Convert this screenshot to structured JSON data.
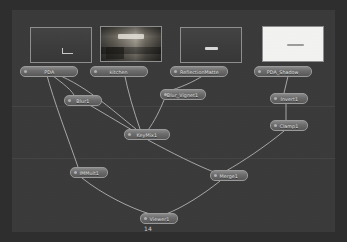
{
  "app": {
    "title": "Node Graph",
    "canvas_background": "#3a3a3a",
    "node_fill": "#6e6e6e",
    "node_border": "#9b9b9b",
    "link_color": "#c9c9c9"
  },
  "frame_counter": "14",
  "read_nodes": [
    {
      "id": "pda",
      "label": "PDA",
      "thumb_kind": "dark",
      "x": 18,
      "y": 17,
      "label_x": 8,
      "label_y": 56
    },
    {
      "id": "kitchen",
      "label": "kitchen",
      "thumb_kind": "photo",
      "x": 88,
      "y": 16,
      "label_x": 78,
      "label_y": 56
    },
    {
      "id": "reflectionmatte",
      "label": "ReflectionMatte",
      "thumb_kind": "dark",
      "x": 168,
      "y": 17,
      "label_x": 158,
      "label_y": 56
    },
    {
      "id": "pda_shadow",
      "label": "PDA_Shadow",
      "thumb_kind": "white",
      "x": 250,
      "y": 16,
      "label_x": 242,
      "label_y": 56
    }
  ],
  "op_nodes": [
    {
      "id": "blur1",
      "label": "Blur1",
      "size": "small",
      "x": 52,
      "y": 85
    },
    {
      "id": "blur_vignet1",
      "label": "Blur_Vignet1",
      "size": "med",
      "x": 148,
      "y": 79
    },
    {
      "id": "keymix1",
      "label": "KeyMix1",
      "size": "med",
      "x": 112,
      "y": 119
    },
    {
      "id": "invert1",
      "label": "Invert1",
      "size": "small",
      "x": 258,
      "y": 83
    },
    {
      "id": "clamp1",
      "label": "Clamp1",
      "size": "small",
      "x": 258,
      "y": 110
    },
    {
      "id": "immult1",
      "label": "IMMult1",
      "size": "small",
      "x": 58,
      "y": 157
    },
    {
      "id": "merge1",
      "label": "Merge1",
      "size": "small",
      "x": 198,
      "y": 160
    },
    {
      "id": "viewer1",
      "label": "Viewer1",
      "size": "small",
      "x": 128,
      "y": 203
    }
  ],
  "links": [
    {
      "from": "pda",
      "to": "blur1"
    },
    {
      "from": "pda",
      "to": "keymix1"
    },
    {
      "from": "pda",
      "to": "immult1"
    },
    {
      "from": "kitchen",
      "to": "keymix1"
    },
    {
      "from": "reflectionmatte",
      "to": "blur_vignet1"
    },
    {
      "from": "blur_vignet1",
      "to": "keymix1"
    },
    {
      "from": "blur1",
      "to": "keymix1"
    },
    {
      "from": "pda_shadow",
      "to": "invert1"
    },
    {
      "from": "invert1",
      "to": "clamp1"
    },
    {
      "from": "clamp1",
      "to": "merge1"
    },
    {
      "from": "keymix1",
      "to": "merge1"
    },
    {
      "from": "immult1",
      "to": "viewer1"
    },
    {
      "from": "merge1",
      "to": "viewer1"
    }
  ],
  "divider_bands": [
    96,
    148
  ]
}
